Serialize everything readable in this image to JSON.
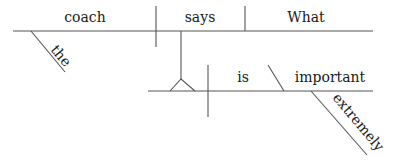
{
  "diagram": {
    "type": "Reed-Kellogg sentence diagram",
    "sentence_words": {
      "subject": "coach",
      "subject_modifier": "the",
      "verb": "says",
      "direct_object": "What",
      "clause_verb": "is",
      "predicate_adjective": "important",
      "adverb": "extremely"
    },
    "colors": {
      "line": "#555555",
      "text": "#1a1a1a",
      "background": "#ffffff"
    }
  }
}
